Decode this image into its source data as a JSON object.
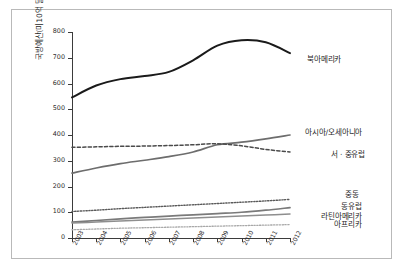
{
  "chart_data": {
    "type": "line",
    "title": "",
    "xlabel": "",
    "ylabel": "국방예산(미10억 달러)",
    "categories": [
      "2003",
      "2004",
      "2005",
      "2006",
      "2007",
      "2008",
      "2009",
      "2010",
      "2011",
      "2012"
    ],
    "x": [
      2003,
      2004,
      2005,
      2006,
      2007,
      2008,
      2009,
      2010,
      2011,
      2012
    ],
    "xlim": [
      2003,
      2012
    ],
    "ylim": [
      0,
      800
    ],
    "yticks": [
      0,
      100,
      200,
      300,
      400,
      500,
      600,
      700,
      800
    ],
    "grid": false,
    "legend_position": "right-inline",
    "series": [
      {
        "name": "북아메리카",
        "style": "solid",
        "color": "#1a1a1a",
        "width": 2.0,
        "values": [
          546,
          592,
          617,
          629,
          645,
          690,
          747,
          768,
          760,
          718
        ]
      },
      {
        "name": "아시아/오세아니아",
        "style": "solid",
        "color": "#6d6d6d",
        "width": 1.7,
        "values": [
          252,
          272,
          289,
          302,
          316,
          334,
          362,
          372,
          385,
          400
        ]
      },
      {
        "name": "서 · 중유럽",
        "style": "dashed",
        "color": "#4a4a4a",
        "width": 1.5,
        "values": [
          352,
          354,
          356,
          357,
          359,
          362,
          366,
          358,
          344,
          334
        ]
      },
      {
        "name": "중동",
        "style": "dotted",
        "color": "#5a5a5a",
        "width": 1.4,
        "values": [
          103,
          108,
          114,
          119,
          124,
          129,
          134,
          139,
          144,
          150
        ]
      },
      {
        "name": "동유럽",
        "style": "solid",
        "color": "#7a7a7a",
        "width": 1.7,
        "values": [
          62,
          68,
          74,
          80,
          85,
          90,
          95,
          100,
          108,
          118
        ]
      },
      {
        "name": "라틴아메리카",
        "style": "solid",
        "color": "#8e8e8e",
        "width": 1.5,
        "values": [
          58,
          62,
          66,
          70,
          74,
          78,
          82,
          85,
          89,
          93
        ]
      },
      {
        "name": "아프리카",
        "style": "dotted",
        "color": "#a8a8a8",
        "width": 1.3,
        "values": [
          32,
          35,
          38,
          40,
          42,
          44,
          46,
          48,
          50,
          52
        ]
      }
    ]
  },
  "axis": {
    "yticks": [
      "0",
      "100",
      "200",
      "300",
      "400",
      "500",
      "600",
      "700",
      "800"
    ],
    "xticks": [
      "2003",
      "2004",
      "2005",
      "2006",
      "2007",
      "2008",
      "2009",
      "2010",
      "2011",
      "2012"
    ],
    "ylabel": "국방예산(미10억 달러)"
  },
  "labels": {
    "north_america": "북아메리카",
    "asia_oceania": "아시아/오세아니아",
    "west_central_europe": "서 · 중유럽",
    "middle_east": "중동",
    "eastern_europe": "동유럽",
    "latin_america": "라틴아메리카",
    "africa": "아프리카"
  }
}
